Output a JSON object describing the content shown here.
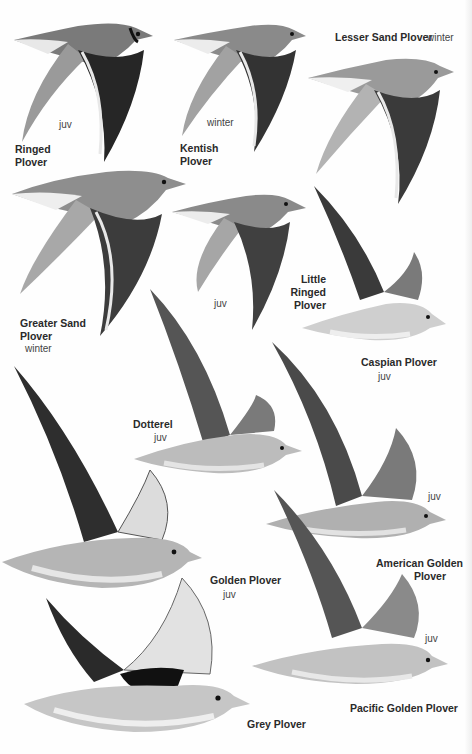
{
  "plate": {
    "species": [
      {
        "name": "Ringed Plover",
        "name_lines": [
          "Ringed",
          "Plover"
        ],
        "age_note": "juv"
      },
      {
        "name": "Kentish Plover",
        "name_lines": [
          "Kentish",
          "Plover"
        ],
        "age_note": "winter"
      },
      {
        "name": "Lesser Sand Plover",
        "name_lines": [
          "Lesser Sand Plover"
        ],
        "age_note": "winter"
      },
      {
        "name": "Greater Sand Plover",
        "name_lines": [
          "Greater Sand",
          "Plover"
        ],
        "age_note": "winter"
      },
      {
        "name": "Little Ringed Plover",
        "name_lines": [
          "Little",
          "Ringed",
          "Plover"
        ],
        "age_note": "juv"
      },
      {
        "name": "Caspian Plover",
        "name_lines": [
          "Caspian Plover"
        ],
        "age_note": "juv"
      },
      {
        "name": "Dotterel",
        "name_lines": [
          "Dotterel"
        ],
        "age_note": "juv"
      },
      {
        "name": "American Golden Plover",
        "name_lines": [
          "American Golden",
          "Plover"
        ],
        "age_note": "juv"
      },
      {
        "name": "Golden Plover",
        "name_lines": [
          "Golden Plover"
        ],
        "age_note": "juv"
      },
      {
        "name": "Pacific Golden Plover",
        "name_lines": [
          "Pacific Golden Plover"
        ],
        "age_note": "juv"
      },
      {
        "name": "Grey Plover",
        "name_lines": [
          "Grey Plover"
        ],
        "age_note": ""
      }
    ]
  },
  "colors": {
    "background": "#fefefe",
    "label_text": "#2a2a2a",
    "note_text": "#444444",
    "wing_dark": "#2b2b2b",
    "wing_mid": "#6e6e6e",
    "body_light": "#c9c9c9",
    "belly": "#ececec"
  }
}
